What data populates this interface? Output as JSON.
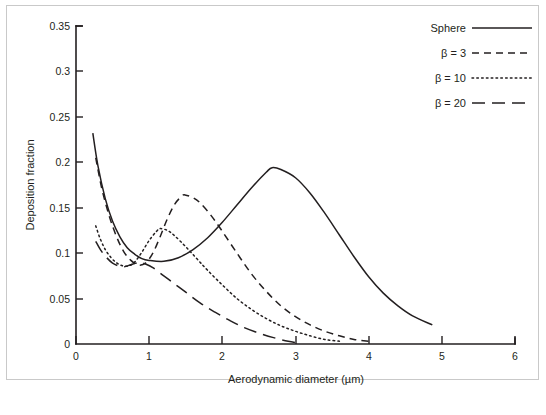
{
  "figure": {
    "background": "#ffffff",
    "frame_color": "#c9c9c9",
    "ink_color": "#231f20"
  },
  "chart_data": {
    "type": "line",
    "title": "",
    "xlabel": "Aerodynamic diameter (µm)",
    "ylabel": "Deposition fraction",
    "xlim": [
      0,
      6
    ],
    "ylim": [
      0,
      0.35
    ],
    "xticks": [
      0,
      1,
      2,
      3,
      4,
      5,
      6
    ],
    "xticklabels": [
      "0",
      "1",
      "2",
      "3",
      "4",
      "5",
      "6"
    ],
    "yticks": [
      0,
      0.05,
      0.1,
      0.15,
      0.2,
      0.25,
      0.3,
      0.35
    ],
    "yticklabels": [
      "0",
      "0.05",
      "0.1",
      "0.15",
      "0.2",
      "0.25",
      "0.3",
      "0.35"
    ],
    "grid": false,
    "legend_position": "top-right",
    "series": [
      {
        "name": "Sphere",
        "linestyle": "solid",
        "x": [
          0.23,
          0.3,
          0.4,
          0.5,
          0.6,
          0.7,
          0.8,
          0.9,
          1.0,
          1.2,
          1.4,
          1.6,
          1.8,
          2.0,
          2.2,
          2.4,
          2.6,
          2.68,
          2.8,
          3.0,
          3.2,
          3.4,
          3.6,
          3.8,
          4.0,
          4.2,
          4.4,
          4.6,
          4.87
        ],
        "y": [
          0.232,
          0.196,
          0.16,
          0.135,
          0.118,
          0.106,
          0.099,
          0.094,
          0.092,
          0.091,
          0.095,
          0.104,
          0.117,
          0.134,
          0.153,
          0.172,
          0.189,
          0.194,
          0.192,
          0.183,
          0.166,
          0.144,
          0.12,
          0.096,
          0.074,
          0.056,
          0.042,
          0.031,
          0.021
        ]
      },
      {
        "name": "β = 3",
        "linestyle": "dashed-medium",
        "x": [
          0.27,
          0.35,
          0.45,
          0.55,
          0.65,
          0.75,
          0.85,
          0.95,
          1.05,
          1.15,
          1.25,
          1.35,
          1.45,
          1.49,
          1.6,
          1.7,
          1.85,
          2.0,
          2.2,
          2.4,
          2.6,
          2.8,
          3.0,
          3.2,
          3.4,
          3.6,
          3.8,
          4.0
        ],
        "y": [
          0.205,
          0.172,
          0.142,
          0.119,
          0.102,
          0.092,
          0.087,
          0.089,
          0.1,
          0.118,
          0.138,
          0.154,
          0.163,
          0.164,
          0.161,
          0.155,
          0.141,
          0.124,
          0.1,
          0.077,
          0.058,
          0.042,
          0.03,
          0.021,
          0.014,
          0.009,
          0.005,
          0.003
        ]
      },
      {
        "name": "β = 10",
        "linestyle": "dotted",
        "x": [
          0.27,
          0.33,
          0.4,
          0.48,
          0.56,
          0.64,
          0.72,
          0.8,
          0.9,
          1.0,
          1.1,
          1.15,
          1.25,
          1.35,
          1.5,
          1.65,
          1.8,
          2.0,
          2.2,
          2.4,
          2.6,
          2.8,
          3.0,
          3.2,
          3.4,
          3.6
        ],
        "y": [
          0.13,
          0.116,
          0.104,
          0.095,
          0.089,
          0.086,
          0.086,
          0.09,
          0.101,
          0.114,
          0.124,
          0.127,
          0.125,
          0.119,
          0.107,
          0.094,
          0.081,
          0.065,
          0.05,
          0.038,
          0.028,
          0.02,
          0.014,
          0.009,
          0.005,
          0.003
        ]
      },
      {
        "name": "β = 20",
        "linestyle": "dashed-long",
        "x": [
          0.27,
          0.34,
          0.42,
          0.5,
          0.58,
          0.66,
          0.74,
          0.82,
          0.86,
          0.95,
          1.05,
          1.2,
          1.35,
          1.5,
          1.7,
          1.9,
          2.1,
          2.3,
          2.5,
          2.7,
          2.9,
          3.05
        ],
        "y": [
          0.113,
          0.103,
          0.095,
          0.089,
          0.086,
          0.085,
          0.087,
          0.089,
          0.09,
          0.088,
          0.084,
          0.075,
          0.066,
          0.057,
          0.045,
          0.035,
          0.026,
          0.018,
          0.012,
          0.007,
          0.003,
          0.001
        ]
      }
    ]
  },
  "legend": {
    "entries": [
      {
        "label": "Sphere",
        "style": "solid"
      },
      {
        "label": "β = 3",
        "style": "dashed-medium"
      },
      {
        "label": "β = 10",
        "style": "dotted"
      },
      {
        "label": "β = 20",
        "style": "dashed-long"
      }
    ]
  }
}
